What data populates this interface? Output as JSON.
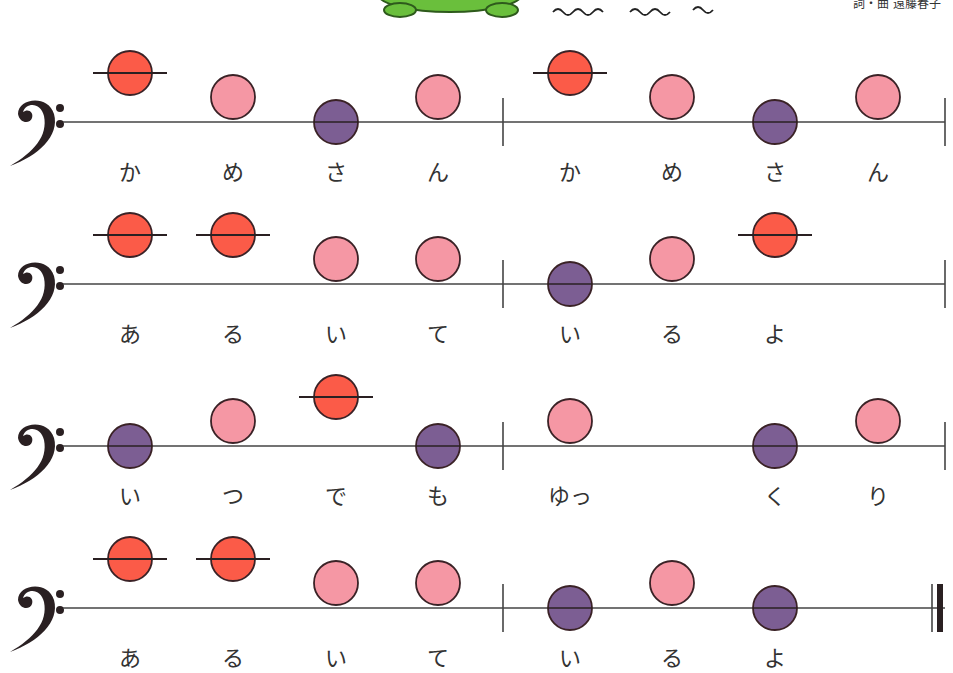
{
  "header": {
    "credit": "詞・曲 遠藤春子",
    "illustration": "turtle-illustration",
    "decoration": "wave-lines"
  },
  "colors": {
    "high": "#fb5b48",
    "mid": "#f597a4",
    "low": "#7c5e93",
    "stroke": "#3a2226",
    "line": "#444444",
    "text": "#333333"
  },
  "layout": {
    "staff_start_x": 63,
    "barline_x": 503,
    "staff_end_x": 945,
    "note_x": [
      130,
      233,
      336,
      438,
      570,
      672,
      775,
      878
    ],
    "note_radius": 22,
    "pitch_offset": {
      "high": -49,
      "mid": -25,
      "low": 0
    }
  },
  "rows": [
    {
      "line_y": 122,
      "end": "single",
      "notes": [
        {
          "pitch": "high",
          "lyric": "か"
        },
        {
          "pitch": "mid",
          "lyric": "め"
        },
        {
          "pitch": "low",
          "lyric": "さ"
        },
        {
          "pitch": "mid",
          "lyric": "ん"
        },
        {
          "pitch": "high",
          "lyric": "か"
        },
        {
          "pitch": "mid",
          "lyric": "め"
        },
        {
          "pitch": "low",
          "lyric": "さ"
        },
        {
          "pitch": "mid",
          "lyric": "ん"
        }
      ]
    },
    {
      "line_y": 284,
      "end": "single",
      "notes": [
        {
          "pitch": "high",
          "lyric": "あ"
        },
        {
          "pitch": "high",
          "lyric": "る"
        },
        {
          "pitch": "mid",
          "lyric": "い"
        },
        {
          "pitch": "mid",
          "lyric": "て"
        },
        {
          "pitch": "low",
          "lyric": "い"
        },
        {
          "pitch": "mid",
          "lyric": "る"
        },
        {
          "pitch": "high",
          "lyric": "よ"
        },
        null
      ]
    },
    {
      "line_y": 446,
      "end": "single",
      "notes": [
        {
          "pitch": "low",
          "lyric": "い"
        },
        {
          "pitch": "mid",
          "lyric": "つ"
        },
        {
          "pitch": "high",
          "lyric": "で"
        },
        {
          "pitch": "low",
          "lyric": "も"
        },
        {
          "pitch": "mid",
          "lyric": "ゆっ"
        },
        null,
        {
          "pitch": "low",
          "lyric": "く"
        },
        {
          "pitch": "mid",
          "lyric": "り"
        }
      ]
    },
    {
      "line_y": 608,
      "end": "final",
      "notes": [
        {
          "pitch": "high",
          "lyric": "あ"
        },
        {
          "pitch": "high",
          "lyric": "る"
        },
        {
          "pitch": "mid",
          "lyric": "い"
        },
        {
          "pitch": "mid",
          "lyric": "て"
        },
        {
          "pitch": "low",
          "lyric": "い"
        },
        {
          "pitch": "mid",
          "lyric": "る"
        },
        {
          "pitch": "low",
          "lyric": "よ"
        },
        null
      ]
    }
  ]
}
